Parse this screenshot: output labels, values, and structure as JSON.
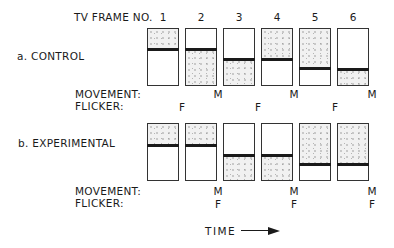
{
  "header": {
    "frame_label": "TV FRAME NO.",
    "frame_numbers": [
      "1",
      "2",
      "3",
      "4",
      "5",
      "6"
    ]
  },
  "conditions": [
    {
      "label": "a. CONTROL",
      "frames": [
        {
          "number": "1",
          "bar_position": 0.35,
          "shaded": "top"
        },
        {
          "number": "2",
          "bar_position": 0.35,
          "shaded": "bottom"
        },
        {
          "number": "3",
          "bar_position": 0.53,
          "shaded": "bottom"
        },
        {
          "number": "4",
          "bar_position": 0.53,
          "shaded": "top"
        },
        {
          "number": "5",
          "bar_position": 0.7,
          "shaded": "top"
        },
        {
          "number": "6",
          "bar_position": 0.7,
          "shaded": "bottom"
        }
      ],
      "movement_label": "MOVEMENT:",
      "flicker_label": "FLICKER:",
      "movement_marks": [
        "M",
        "M",
        "M"
      ],
      "movement_after_frames": [
        2,
        4,
        6
      ],
      "flicker_marks": [
        "F",
        "F",
        "F"
      ],
      "flicker_after_frames": [
        1,
        3,
        5
      ]
    },
    {
      "label": "b. EXPERIMENTAL",
      "frames": [
        {
          "number": "1",
          "bar_position": 0.37,
          "shaded": "top"
        },
        {
          "number": "2",
          "bar_position": 0.37,
          "shaded": "top"
        },
        {
          "number": "3",
          "bar_position": 0.54,
          "shaded": "bottom"
        },
        {
          "number": "4",
          "bar_position": 0.54,
          "shaded": "bottom"
        },
        {
          "number": "5",
          "bar_position": 0.7,
          "shaded": "top"
        },
        {
          "number": "6",
          "bar_position": 0.7,
          "shaded": "top"
        }
      ],
      "movement_label": "MOVEMENT:",
      "flicker_label": "FLICKER:",
      "movement_marks": [
        "M",
        "M",
        "M"
      ],
      "movement_after_frames": [
        2,
        4,
        6
      ],
      "flicker_marks": [
        "F",
        "F",
        "F"
      ],
      "flicker_after_frames": [
        2,
        4,
        6
      ]
    }
  ],
  "footer": {
    "time_label": "TIME",
    "arrow": "right-arrow"
  }
}
